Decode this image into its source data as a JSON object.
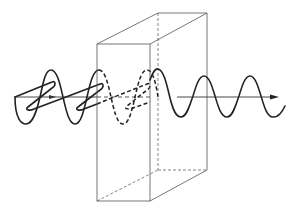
{
  "figure": {
    "colors": {
      "background": "#ffffff",
      "lines": "#222222",
      "box_edges": "#555555"
    },
    "elements": [
      {
        "name": "incident-wave",
        "style": "solid",
        "components": [
          "vertical oscillation",
          "oblique oscillation"
        ]
      },
      {
        "name": "wave-inside-crystal",
        "style": "dashed"
      },
      {
        "name": "crystal-block",
        "style": "3D rectangular prism, hidden edges dashed"
      },
      {
        "name": "transmitted-wave",
        "style": "solid",
        "components": [
          "single oscillation plane"
        ]
      },
      {
        "name": "propagation-axis",
        "style": "arrow pointing right"
      }
    ]
  }
}
